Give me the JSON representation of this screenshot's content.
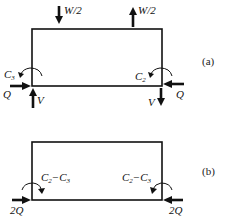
{
  "diagram": {
    "colors": {
      "ink": "#111111",
      "background": "#ffffff"
    },
    "panels": [
      {
        "id": "a",
        "label": "(a)",
        "forces": {
          "top_left_load": "W/2",
          "top_right_load": "W/2",
          "left_moment": "C",
          "left_moment_sub": "3",
          "right_moment": "C",
          "right_moment_sub": "2",
          "left_horizontal": "Q",
          "right_horizontal": "Q",
          "left_vertical": "V",
          "right_vertical": "V"
        }
      },
      {
        "id": "b",
        "label": "(b)",
        "forces": {
          "left_moment_main": "C",
          "left_moment_sub1": "2",
          "left_moment_op": "−C",
          "left_moment_sub2": "3",
          "right_moment_main": "C",
          "right_moment_sub1": "2",
          "right_moment_op": "−C",
          "right_moment_sub2": "3",
          "left_horizontal": "2Q",
          "right_horizontal": "2Q"
        }
      }
    ]
  }
}
